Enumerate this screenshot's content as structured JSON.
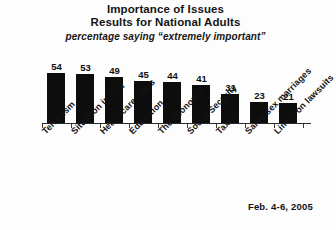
{
  "chart_data": {
    "type": "bar",
    "title": "Importance of Issues",
    "subtitle": "Results for National Adults",
    "note": "percentage saying “extremely important”",
    "categories": [
      "Terrorism",
      "Situation in Iraq",
      "Healthcare costs",
      "Education",
      "The economy",
      "Social Security",
      "Taxes",
      "Same-sex marriages",
      "Limits on lawsuits"
    ],
    "values": [
      54,
      53,
      49,
      45,
      44,
      41,
      31,
      23,
      21
    ],
    "value_labels": [
      "54",
      "53",
      "49",
      "45",
      "44",
      "41",
      "31",
      "23",
      "21"
    ],
    "xlabel": "",
    "ylabel": "",
    "ylim": [
      0,
      60
    ],
    "grid": false,
    "legend": false,
    "bar_color": "#0d0d0d",
    "background_color": "#fdfdfd",
    "axis_color": "#2b2b2b",
    "footer": "Feb. 4-6, 2005"
  }
}
